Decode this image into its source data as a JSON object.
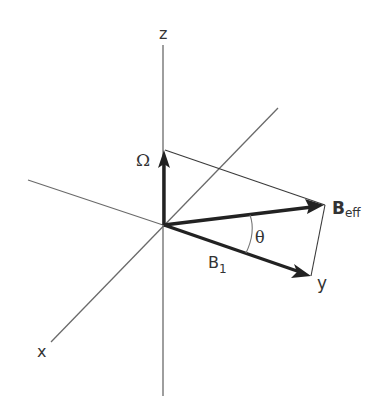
{
  "diagram": {
    "axes": {
      "x_label": "x",
      "y_label": "y",
      "z_label": "z"
    },
    "vectors": {
      "omega": {
        "symbol": "Ω"
      },
      "b_eff": {
        "main": "B",
        "sub": "eff"
      },
      "b_1": {
        "main": "B",
        "sub": "1"
      }
    },
    "angle_label": "θ",
    "colors": {
      "axis": "#6a6a6a",
      "vector": "#222222",
      "text": "#333333"
    }
  }
}
